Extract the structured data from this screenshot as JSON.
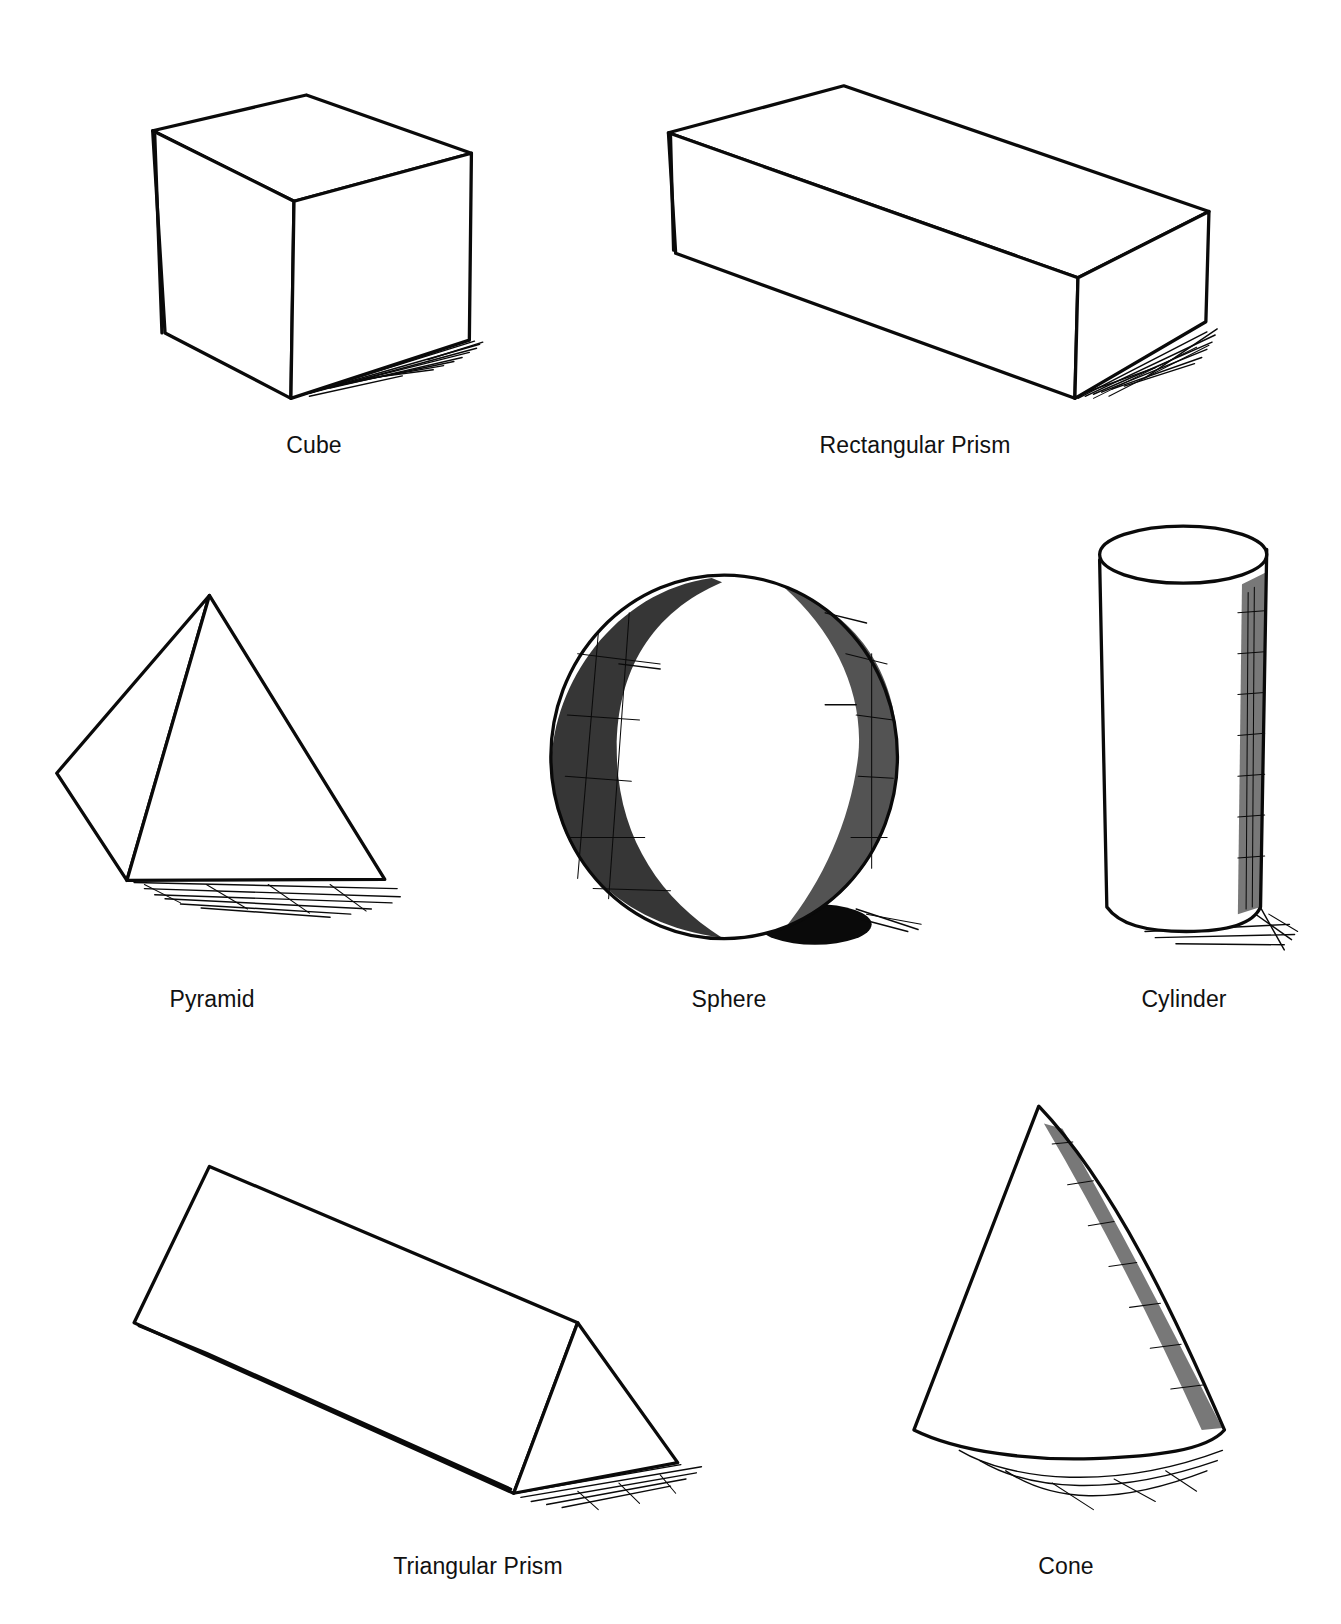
{
  "figure": {
    "ink_color": "#0a0a0a",
    "background": "#ffffff"
  },
  "shapes": [
    {
      "id": "cube",
      "label": "Cube",
      "shading": "cast shadow lower right"
    },
    {
      "id": "rectangular-prism",
      "label": "Rectangular Prism",
      "shading": "cast shadow lower right"
    },
    {
      "id": "pyramid",
      "label": "Pyramid",
      "shading": "cast shadow below base"
    },
    {
      "id": "sphere",
      "label": "Sphere",
      "shading": "cross-hatched core shadow on edges, cast shadow lower right"
    },
    {
      "id": "cylinder",
      "label": "Cylinder",
      "shading": "cross-hatched right side, cast shadow lower right"
    },
    {
      "id": "triangular-prism",
      "label": "Triangular Prism",
      "shading": "cast shadow below right end"
    },
    {
      "id": "cone",
      "label": "Cone",
      "shading": "cross-hatched right side, cast shadow below base"
    }
  ]
}
